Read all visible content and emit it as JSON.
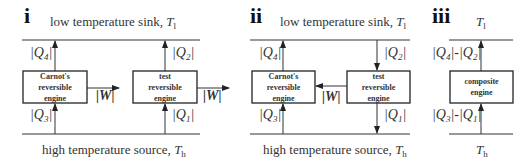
{
  "panels": [
    {
      "id": "i",
      "label": "i",
      "sink_text": "low temperature sink, ",
      "sink_sym": "T",
      "sink_sub": "l",
      "source_text": "high temperature source, ",
      "source_sym": "T",
      "source_sub": "h",
      "boxes": [
        {
          "lines": [
            "Carnot's",
            "reversible",
            "engine"
          ]
        },
        {
          "lines": [
            "test",
            "reversible",
            "engine"
          ]
        }
      ],
      "flows": {
        "q4": "|Q4|",
        "q3": "|Q3|",
        "q2": "|Q2|",
        "q1": "|Q1|",
        "w1": "|W|",
        "w2": "|W|"
      },
      "direction": "test engine runs forward, Carnot forward; both output work"
    },
    {
      "id": "ii",
      "label": "ii",
      "sink_text": "low temperature sink, ",
      "sink_sym": "T",
      "sink_sub": "l",
      "source_text": "high temperature source, ",
      "source_sym": "T",
      "source_sub": "h",
      "boxes": [
        {
          "lines": [
            "Carnot's",
            "reversible",
            "engine"
          ]
        },
        {
          "lines": [
            "test",
            "reversible",
            "engine"
          ]
        }
      ],
      "flows": {
        "q4": "|Q4|",
        "q3": "|Q3|",
        "q2": "|Q2|",
        "q1": "|Q1|",
        "w": "|W|"
      },
      "direction": "test engine reversed, its work drives Carnot engine"
    },
    {
      "id": "iii",
      "label": "iii",
      "sink_sym": "T",
      "sink_sub": "l",
      "source_sym": "T",
      "source_sub": "h",
      "boxes": [
        {
          "lines": [
            "composite",
            "engine"
          ]
        }
      ],
      "flows": {
        "top": "|Q4| - |Q2|",
        "bottom": "|Q3| - |Q1|"
      }
    }
  ],
  "colors": {
    "stroke": "#333333",
    "text": "#222222",
    "background": "#ffffff"
  }
}
